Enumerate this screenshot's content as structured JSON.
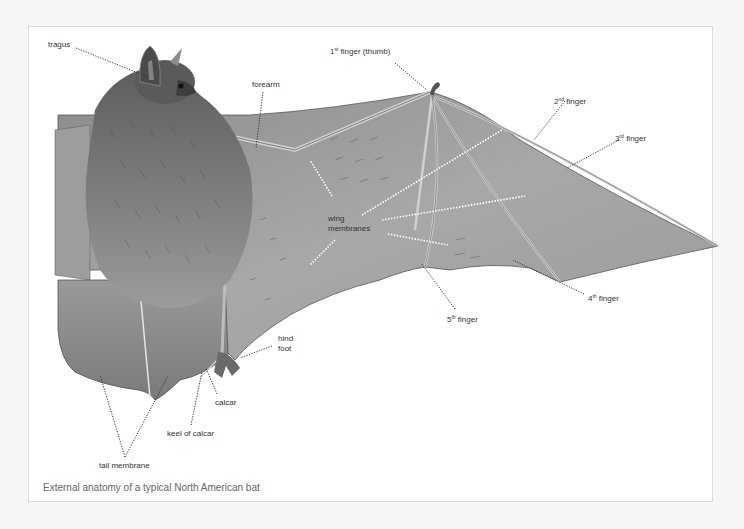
{
  "figure": {
    "caption": "External anatomy of a typical North American bat"
  },
  "labels": {
    "tragus": "tragus",
    "forearm": "forearm",
    "finger1_num": "1",
    "finger1_sup": "st",
    "finger1_text": " finger (thumb)",
    "finger2_num": "2",
    "finger2_sup": "nd",
    "finger2_text": " finger",
    "finger3_num": "3",
    "finger3_sup": "rd",
    "finger3_text": " finger",
    "finger4_num": "4",
    "finger4_sup": "th",
    "finger4_text": " finger",
    "finger5_num": "5",
    "finger5_sup": "th",
    "finger5_text": " finger",
    "wing_membranes_1": "wing",
    "wing_membranes_2": "membranes",
    "hind_foot_1": "hind",
    "hind_foot_2": "foot",
    "calcar": "calcar",
    "keel_of_calcar": "keel of calcar",
    "tail_membrane": "tail membrane"
  },
  "colors": {
    "background": "#f6f6f6",
    "frame": "#ffffff",
    "leader_dark": "#333333",
    "leader_light": "#ffffff",
    "membrane": "#9a9a9a",
    "fur": "#7a7a7a"
  }
}
